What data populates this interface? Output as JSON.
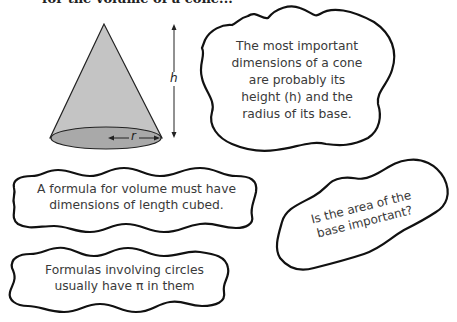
{
  "header": {
    "truncated_text": "for the volume of a cone..."
  },
  "diagram": {
    "shape": "cone",
    "labels": {
      "height": "h",
      "radius": "r"
    },
    "colors": {
      "cone_fill": "#c4c4c4",
      "base_fill": "#a8a8a8",
      "outline": "#222222"
    }
  },
  "bubbles": [
    {
      "text_lines": [
        "The most important",
        "dimensions of a cone",
        "are probably its",
        "height (h) and the",
        "radius of its base."
      ]
    },
    {
      "text_lines": [
        "A formula for volume must have",
        "dimensions of length cubed."
      ]
    },
    {
      "text_lines": [
        "Is the area of the",
        "base important?"
      ]
    },
    {
      "text_lines": [
        "Formulas involving circles",
        "usually have π in them"
      ]
    }
  ]
}
